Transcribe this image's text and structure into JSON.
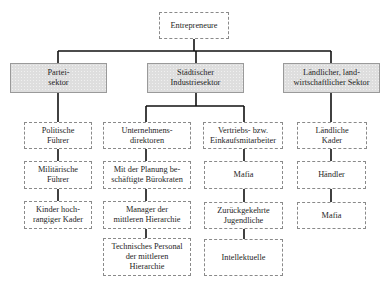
{
  "diagram": {
    "root": {
      "id": "root",
      "label": "Entrepreneure"
    },
    "sectors": [
      {
        "id": "partei",
        "label": "Partei-\nsektor",
        "shaded": true,
        "children": [
          {
            "id": "p1",
            "label": "Politische\nFührer"
          },
          {
            "id": "p2",
            "label": "Militärische\nFührer"
          },
          {
            "id": "p3",
            "label": "Kinder hoch-\nrangiger Kader"
          }
        ]
      },
      {
        "id": "staedtisch",
        "label": "Städtischer\nIndustriesektor",
        "shaded": true,
        "columns": [
          [
            {
              "id": "s1",
              "label": "Unternehmens-\ndirektoren"
            },
            {
              "id": "s2",
              "label": "Mit der Planung be-\nschäftigte Bürokraten"
            },
            {
              "id": "s3",
              "label": "Manager der\nmittleren Hierarchie"
            },
            {
              "id": "s4",
              "label": "Technisches Personal\nder mittleren\nHierarchie"
            }
          ],
          [
            {
              "id": "s5",
              "label": "Vertriebs- bzw.\nEinkaufsmitarbeiter"
            },
            {
              "id": "s6",
              "label": "Mafia"
            },
            {
              "id": "s7",
              "label": "Zurückgekehrte\nJugendliche"
            },
            {
              "id": "s8",
              "label": "Intellektuelle"
            }
          ]
        ]
      },
      {
        "id": "laendlich",
        "label": "Ländlicher, land-\nwirtschaftlicher Sektor",
        "shaded": true,
        "children": [
          {
            "id": "l1",
            "label": "Ländliche\nKader"
          },
          {
            "id": "l2",
            "label": "Händler"
          },
          {
            "id": "l3",
            "label": "Mafia"
          }
        ]
      }
    ],
    "colors": {
      "line": "#111111",
      "sector_fill": "#dedede",
      "box_border": "#8a8a8a"
    }
  }
}
